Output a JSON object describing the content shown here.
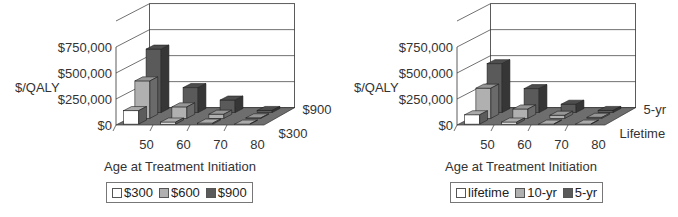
{
  "chart_data": [
    {
      "type": "bar",
      "subtype": "3d-clustered-depth",
      "title": "",
      "xlabel": "Age at Treatment Initiation",
      "ylabel": "$/QALY",
      "categories": [
        "50",
        "60",
        "70",
        "80"
      ],
      "depth_labels": [
        "$900",
        "$300"
      ],
      "yticks": [
        "$0",
        "$250,000",
        "$500,000",
        "$750,000"
      ],
      "ylim": [
        0,
        1000000
      ],
      "series": [
        {
          "name": "$300",
          "color": "#ffffff",
          "values": [
            130000,
            20000,
            10000,
            0
          ]
        },
        {
          "name": "$600",
          "color": "#b0b0b0",
          "values": [
            360000,
            110000,
            40000,
            5000
          ]
        },
        {
          "name": "$900",
          "color": "#5a5a5a",
          "values": [
            610000,
            240000,
            120000,
            20000
          ]
        }
      ],
      "legend": {
        "position": "bottom",
        "entries": [
          "$300",
          "$600",
          "$900"
        ]
      },
      "grid": true
    },
    {
      "type": "bar",
      "subtype": "3d-clustered-depth",
      "title": "",
      "xlabel": "Age at Treatment Initiation",
      "ylabel": "$/QALY",
      "categories": [
        "50",
        "60",
        "70",
        "80"
      ],
      "depth_labels": [
        "5-yr",
        "Lifetime"
      ],
      "yticks": [
        "$0",
        "$250,000",
        "$500,000",
        "$750,000"
      ],
      "ylim": [
        0,
        1000000
      ],
      "series": [
        {
          "name": "lifetime",
          "color": "#ffffff",
          "values": [
            90000,
            20000,
            0,
            0
          ]
        },
        {
          "name": "10-yr",
          "color": "#b0b0b0",
          "values": [
            290000,
            90000,
            30000,
            10000
          ]
        },
        {
          "name": "5-yr",
          "color": "#5a5a5a",
          "values": [
            470000,
            230000,
            80000,
            20000
          ]
        }
      ],
      "legend": {
        "position": "bottom",
        "entries": [
          "lifetime",
          "10-yr",
          "5-yr"
        ]
      },
      "grid": true
    }
  ]
}
